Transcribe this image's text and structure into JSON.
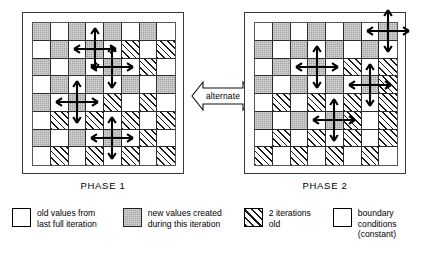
{
  "diagram": {
    "alternate_label": "alternate",
    "phases": [
      {
        "id": "phase-1",
        "caption": "PHASE 1",
        "grid": {
          "rows": 8,
          "cols": 8,
          "legend_key": {
            "w": "old values (white)",
            "g": "new values (gray)",
            "h": "2 iterations old (hatched)"
          },
          "cells": [
            [
              "g",
              "w",
              "g",
              "w",
              "g",
              "w",
              "g",
              "w"
            ],
            [
              "w",
              "g",
              "w",
              "g",
              "w",
              "h",
              "w",
              "h"
            ],
            [
              "g",
              "w",
              "g",
              "w",
              "g",
              "w",
              "h",
              "w"
            ],
            [
              "w",
              "g",
              "w",
              "g",
              "w",
              "g",
              "w",
              "g"
            ],
            [
              "g",
              "w",
              "g",
              "w",
              "h",
              "w",
              "h",
              "w"
            ],
            [
              "w",
              "h",
              "w",
              "h",
              "w",
              "h",
              "w",
              "h"
            ],
            [
              "g",
              "w",
              "g",
              "w",
              "g",
              "w",
              "h",
              "w"
            ],
            [
              "w",
              "h",
              "w",
              "h",
              "w",
              "h",
              "w",
              "h"
            ]
          ],
          "stencils": [
            {
              "row": 1,
              "col": 3,
              "kind": "full"
            },
            {
              "row": 2,
              "col": 4,
              "kind": "full"
            },
            {
              "row": 4,
              "col": 2,
              "kind": "full"
            },
            {
              "row": 6,
              "col": 4,
              "kind": "full"
            }
          ]
        }
      },
      {
        "id": "phase-2",
        "caption": "PHASE 2",
        "grid": {
          "rows": 8,
          "cols": 8,
          "cells": [
            [
              "w",
              "g",
              "w",
              "g",
              "w",
              "g",
              "w",
              "g"
            ],
            [
              "g",
              "w",
              "g",
              "w",
              "g",
              "w",
              "g",
              "w"
            ],
            [
              "w",
              "g",
              "w",
              "g",
              "w",
              "h",
              "w",
              "h"
            ],
            [
              "g",
              "w",
              "g",
              "w",
              "g",
              "w",
              "g",
              "h"
            ],
            [
              "w",
              "h",
              "w",
              "h",
              "w",
              "h",
              "w",
              "h"
            ],
            [
              "g",
              "w",
              "g",
              "w",
              "g",
              "h",
              "w",
              "h"
            ],
            [
              "w",
              "h",
              "w",
              "h",
              "w",
              "h",
              "w",
              "h"
            ],
            [
              "h",
              "w",
              "h",
              "w",
              "h",
              "w",
              "h",
              "w"
            ]
          ],
          "stencils": [
            {
              "row": 0,
              "col": 7,
              "kind": "full"
            },
            {
              "row": 2,
              "col": 3,
              "kind": "full"
            },
            {
              "row": 3,
              "col": 6,
              "kind": "full"
            },
            {
              "row": 5,
              "col": 4,
              "kind": "full"
            }
          ]
        }
      }
    ]
  },
  "legend": {
    "items": [
      {
        "id": "old",
        "swatch": "white",
        "text": "old values from\nlast full iteration"
      },
      {
        "id": "new",
        "swatch": "gray",
        "text": "new values created\nduring this iteration"
      },
      {
        "id": "two-iter",
        "swatch": "hatched",
        "text": "2 iterations\nold"
      },
      {
        "id": "boundary",
        "swatch": "white",
        "text": "boundary\nconditions\n(constant)"
      }
    ]
  },
  "colors": {
    "gray_fill": "#a6a6a6",
    "line": "#2b2b2b",
    "hatch": "#1a1a1a",
    "background": "#ffffff"
  }
}
